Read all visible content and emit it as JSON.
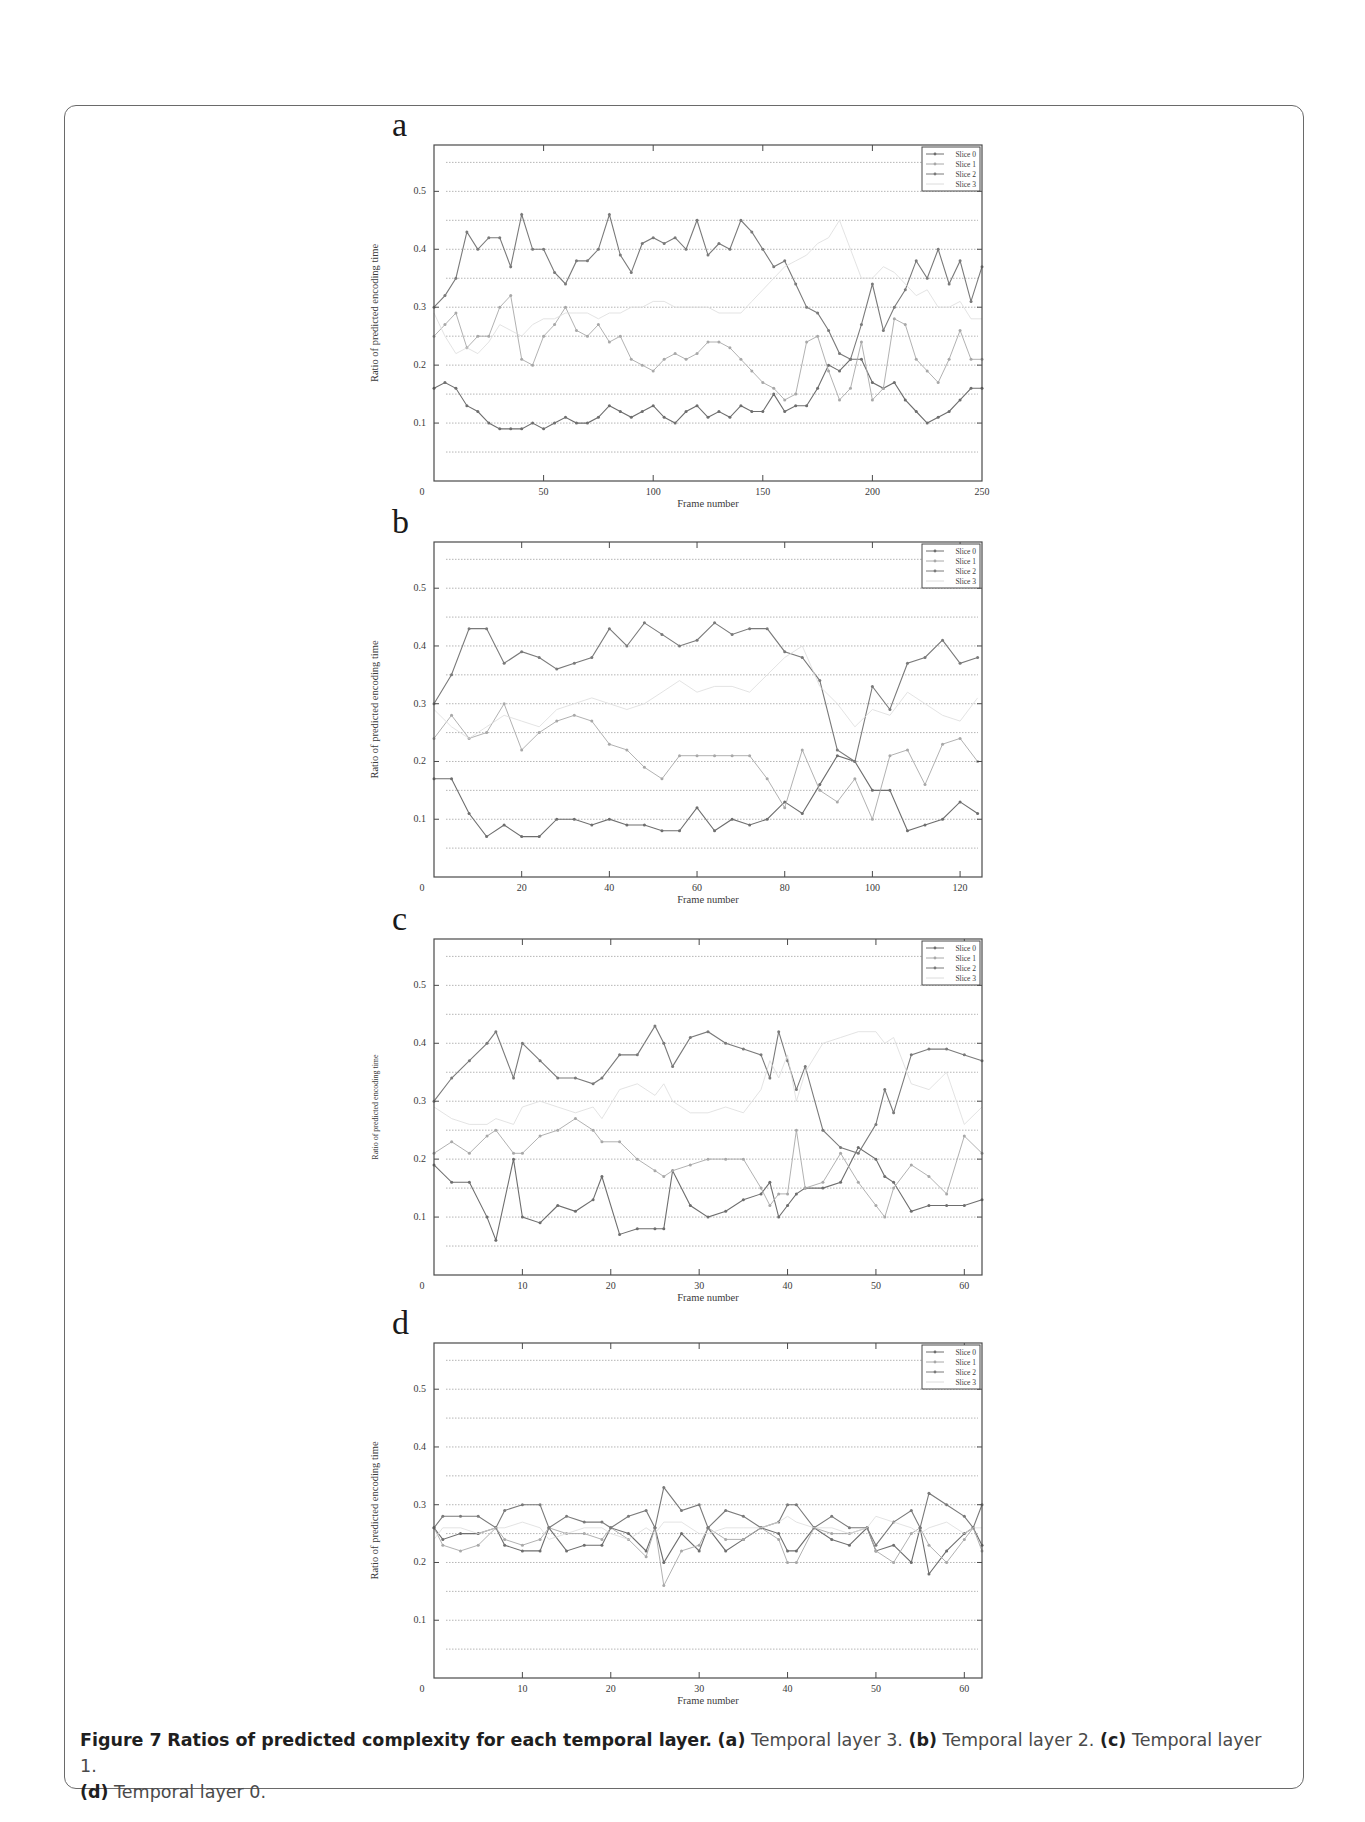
{
  "figure": {
    "caption": {
      "label": "Figure 7",
      "title": "Ratios of predicted complexity for each temporal layer.",
      "parts": [
        {
          "tag": "(a)",
          "text": "Temporal layer 3."
        },
        {
          "tag": "(b)",
          "text": "Temporal layer 2."
        },
        {
          "tag": "(c)",
          "text": "Temporal layer 1."
        },
        {
          "tag": "(d)",
          "text": "Temporal layer 0."
        }
      ]
    },
    "colors": {
      "frame_border": "#6a6a6a",
      "axis": "#4a4a4a",
      "grid": "#b5b5b5",
      "slice0": "#6e6e6e",
      "slice1": "#a8a8a8",
      "slice2": "#7a7a7a",
      "slice3": "#dcdcdc"
    }
  },
  "chart_data": [
    {
      "panel": "a",
      "type": "line",
      "title": "",
      "xlabel": "Frame number",
      "ylabel": "Ratio of predicted encoding time",
      "xlim": [
        0,
        250
      ],
      "ylim": [
        0,
        0.58
      ],
      "xticks": [
        0,
        50,
        100,
        150,
        200,
        250
      ],
      "yticks": [
        0.1,
        0.2,
        0.3,
        0.4,
        0.5
      ],
      "grid": true,
      "grid_step": 0.05,
      "legend": [
        "Slice 0",
        "Slice 1",
        "Slice 2",
        "Slice 3"
      ],
      "legend_position": "upper right",
      "x": [
        0,
        5,
        10,
        15,
        20,
        25,
        30,
        35,
        40,
        45,
        50,
        55,
        60,
        65,
        70,
        75,
        80,
        85,
        90,
        95,
        100,
        105,
        110,
        115,
        120,
        125,
        130,
        135,
        140,
        145,
        150,
        155,
        160,
        165,
        170,
        175,
        180,
        185,
        190,
        195,
        200,
        205,
        210,
        215,
        220,
        225,
        230,
        235,
        240,
        245,
        250
      ],
      "series": [
        {
          "name": "Slice 0",
          "values": [
            0.16,
            0.17,
            0.16,
            0.13,
            0.12,
            0.1,
            0.09,
            0.09,
            0.09,
            0.1,
            0.09,
            0.1,
            0.11,
            0.1,
            0.1,
            0.11,
            0.13,
            0.12,
            0.11,
            0.12,
            0.13,
            0.11,
            0.1,
            0.12,
            0.13,
            0.11,
            0.12,
            0.11,
            0.13,
            0.12,
            0.12,
            0.15,
            0.12,
            0.13,
            0.13,
            0.16,
            0.2,
            0.19,
            0.21,
            0.21,
            0.17,
            0.16,
            0.17,
            0.14,
            0.12,
            0.1,
            0.11,
            0.12,
            0.14,
            0.16,
            0.16
          ]
        },
        {
          "name": "Slice 1",
          "values": [
            0.25,
            0.27,
            0.29,
            0.23,
            0.25,
            0.25,
            0.3,
            0.32,
            0.21,
            0.2,
            0.25,
            0.27,
            0.3,
            0.26,
            0.25,
            0.27,
            0.24,
            0.25,
            0.21,
            0.2,
            0.19,
            0.21,
            0.22,
            0.21,
            0.22,
            0.24,
            0.24,
            0.23,
            0.21,
            0.19,
            0.17,
            0.16,
            0.14,
            0.15,
            0.24,
            0.25,
            0.19,
            0.14,
            0.16,
            0.24,
            0.14,
            0.16,
            0.28,
            0.27,
            0.21,
            0.19,
            0.17,
            0.21,
            0.26,
            0.21,
            0.21
          ]
        },
        {
          "name": "Slice 2",
          "values": [
            0.3,
            0.32,
            0.35,
            0.43,
            0.4,
            0.42,
            0.42,
            0.37,
            0.46,
            0.4,
            0.4,
            0.36,
            0.34,
            0.38,
            0.38,
            0.4,
            0.46,
            0.39,
            0.36,
            0.41,
            0.42,
            0.41,
            0.42,
            0.4,
            0.45,
            0.39,
            0.41,
            0.4,
            0.45,
            0.43,
            0.4,
            0.37,
            0.38,
            0.34,
            0.3,
            0.29,
            0.26,
            0.22,
            0.21,
            0.27,
            0.34,
            0.26,
            0.3,
            0.33,
            0.38,
            0.35,
            0.4,
            0.34,
            0.38,
            0.31,
            0.37
          ]
        },
        {
          "name": "Slice 3",
          "values": [
            0.29,
            0.25,
            0.22,
            0.23,
            0.22,
            0.24,
            0.27,
            0.26,
            0.25,
            0.27,
            0.28,
            0.28,
            0.29,
            0.29,
            0.29,
            0.28,
            0.29,
            0.29,
            0.3,
            0.3,
            0.31,
            0.31,
            0.3,
            0.3,
            0.3,
            0.3,
            0.29,
            0.29,
            0.29,
            0.31,
            0.33,
            0.35,
            0.37,
            0.38,
            0.39,
            0.41,
            0.42,
            0.45,
            0.4,
            0.35,
            0.35,
            0.37,
            0.36,
            0.34,
            0.32,
            0.33,
            0.3,
            0.3,
            0.31,
            0.28,
            0.28
          ]
        }
      ]
    },
    {
      "panel": "b",
      "type": "line",
      "title": "",
      "xlabel": "Frame number",
      "ylabel": "Ratio of predicted encoding time",
      "xlim": [
        0,
        125
      ],
      "ylim": [
        0,
        0.58
      ],
      "xticks": [
        0,
        20,
        40,
        60,
        80,
        100,
        120
      ],
      "yticks": [
        0.1,
        0.2,
        0.3,
        0.4,
        0.5
      ],
      "grid": true,
      "grid_step": 0.05,
      "legend": [
        "Slice 0",
        "Slice 1",
        "Slice 2",
        "Slice 3"
      ],
      "legend_position": "upper right",
      "x": [
        0,
        4,
        8,
        12,
        16,
        20,
        24,
        28,
        32,
        36,
        40,
        44,
        48,
        52,
        56,
        60,
        64,
        68,
        72,
        76,
        80,
        84,
        88,
        92,
        96,
        100,
        104,
        108,
        112,
        116,
        120,
        124
      ],
      "series": [
        {
          "name": "Slice 0",
          "values": [
            0.17,
            0.17,
            0.11,
            0.07,
            0.09,
            0.07,
            0.07,
            0.1,
            0.1,
            0.09,
            0.1,
            0.09,
            0.09,
            0.08,
            0.08,
            0.12,
            0.08,
            0.1,
            0.09,
            0.1,
            0.13,
            0.11,
            0.16,
            0.21,
            0.2,
            0.15,
            0.15,
            0.08,
            0.09,
            0.1,
            0.13,
            0.11
          ]
        },
        {
          "name": "Slice 1",
          "values": [
            0.24,
            0.28,
            0.24,
            0.25,
            0.3,
            0.22,
            0.25,
            0.27,
            0.28,
            0.27,
            0.23,
            0.22,
            0.19,
            0.17,
            0.21,
            0.21,
            0.21,
            0.21,
            0.21,
            0.17,
            0.12,
            0.22,
            0.15,
            0.13,
            0.17,
            0.1,
            0.21,
            0.22,
            0.16,
            0.23,
            0.24,
            0.2
          ]
        },
        {
          "name": "Slice 2",
          "values": [
            0.3,
            0.35,
            0.43,
            0.43,
            0.37,
            0.39,
            0.38,
            0.36,
            0.37,
            0.38,
            0.43,
            0.4,
            0.44,
            0.42,
            0.4,
            0.41,
            0.44,
            0.42,
            0.43,
            0.43,
            0.39,
            0.38,
            0.34,
            0.22,
            0.2,
            0.33,
            0.29,
            0.37,
            0.38,
            0.41,
            0.37,
            0.38
          ]
        },
        {
          "name": "Slice 3",
          "values": [
            0.29,
            0.26,
            0.24,
            0.26,
            0.28,
            0.27,
            0.26,
            0.29,
            0.3,
            0.31,
            0.3,
            0.29,
            0.3,
            0.32,
            0.34,
            0.32,
            0.33,
            0.33,
            0.32,
            0.35,
            0.38,
            0.4,
            0.33,
            0.3,
            0.26,
            0.29,
            0.28,
            0.32,
            0.3,
            0.28,
            0.27,
            0.31
          ]
        }
      ]
    },
    {
      "panel": "c",
      "type": "line",
      "title": "",
      "xlabel": "Frame number",
      "ylabel": "Ratio of predicted encoding time",
      "xlim": [
        0,
        62
      ],
      "ylim": [
        0,
        0.58
      ],
      "xticks": [
        0,
        10,
        20,
        30,
        40,
        50,
        60
      ],
      "yticks": [
        0.1,
        0.2,
        0.3,
        0.4,
        0.5
      ],
      "grid": true,
      "grid_step": 0.05,
      "legend": [
        "Slice 0",
        "Slice 1",
        "Slice 2",
        "Slice 3"
      ],
      "legend_position": "upper right",
      "x": [
        0,
        2,
        4,
        6,
        7,
        9,
        10,
        12,
        14,
        16,
        18,
        19,
        21,
        23,
        25,
        26,
        27,
        29,
        31,
        33,
        35,
        37,
        38,
        39,
        40,
        41,
        42,
        44,
        46,
        48,
        50,
        51,
        52,
        54,
        56,
        58,
        60,
        62
      ],
      "series": [
        {
          "name": "Slice 0",
          "values": [
            0.19,
            0.16,
            0.16,
            0.1,
            0.06,
            0.2,
            0.1,
            0.09,
            0.12,
            0.11,
            0.13,
            0.17,
            0.07,
            0.08,
            0.08,
            0.08,
            0.18,
            0.12,
            0.1,
            0.11,
            0.13,
            0.14,
            0.16,
            0.1,
            0.12,
            0.14,
            0.15,
            0.15,
            0.16,
            0.22,
            0.2,
            0.17,
            0.16,
            0.11,
            0.12,
            0.12,
            0.12,
            0.13
          ]
        },
        {
          "name": "Slice 1",
          "values": [
            0.21,
            0.23,
            0.21,
            0.24,
            0.25,
            0.21,
            0.21,
            0.24,
            0.25,
            0.27,
            0.25,
            0.23,
            0.23,
            0.2,
            0.18,
            0.17,
            0.18,
            0.19,
            0.2,
            0.2,
            0.2,
            0.15,
            0.12,
            0.14,
            0.14,
            0.25,
            0.15,
            0.16,
            0.21,
            0.16,
            0.12,
            0.1,
            0.15,
            0.19,
            0.17,
            0.14,
            0.24,
            0.21
          ]
        },
        {
          "name": "Slice 2",
          "values": [
            0.3,
            0.34,
            0.37,
            0.4,
            0.42,
            0.34,
            0.4,
            0.37,
            0.34,
            0.34,
            0.33,
            0.34,
            0.38,
            0.38,
            0.43,
            0.4,
            0.36,
            0.41,
            0.42,
            0.4,
            0.39,
            0.38,
            0.34,
            0.42,
            0.37,
            0.32,
            0.36,
            0.25,
            0.22,
            0.21,
            0.26,
            0.32,
            0.28,
            0.38,
            0.39,
            0.39,
            0.38,
            0.37
          ]
        },
        {
          "name": "Slice 3",
          "values": [
            0.29,
            0.27,
            0.26,
            0.26,
            0.27,
            0.26,
            0.29,
            0.3,
            0.29,
            0.28,
            0.29,
            0.27,
            0.32,
            0.33,
            0.31,
            0.33,
            0.3,
            0.28,
            0.28,
            0.29,
            0.28,
            0.32,
            0.37,
            0.34,
            0.38,
            0.3,
            0.35,
            0.4,
            0.41,
            0.42,
            0.42,
            0.4,
            0.41,
            0.33,
            0.32,
            0.35,
            0.26,
            0.29
          ]
        }
      ]
    },
    {
      "panel": "d",
      "type": "line",
      "title": "",
      "xlabel": "Frame number",
      "ylabel": "Ratio of predicted encoding time",
      "xlim": [
        0,
        62
      ],
      "ylim": [
        0,
        0.58
      ],
      "xticks": [
        0,
        10,
        20,
        30,
        40,
        50,
        60
      ],
      "yticks": [
        0.1,
        0.2,
        0.3,
        0.4,
        0.5
      ],
      "grid": true,
      "grid_step": 0.05,
      "legend": [
        "Slice 0",
        "Slice 1",
        "Slice 2",
        "Slice 3"
      ],
      "legend_position": "upper right",
      "x": [
        0,
        1,
        3,
        5,
        7,
        8,
        10,
        12,
        13,
        15,
        17,
        19,
        20,
        22,
        24,
        25,
        26,
        28,
        30,
        31,
        33,
        35,
        37,
        39,
        40,
        41,
        43,
        45,
        47,
        49,
        50,
        52,
        54,
        55,
        56,
        58,
        60,
        61,
        62
      ],
      "series": [
        {
          "name": "Slice 0",
          "values": [
            0.26,
            0.24,
            0.25,
            0.25,
            0.26,
            0.23,
            0.22,
            0.22,
            0.26,
            0.22,
            0.23,
            0.23,
            0.26,
            0.25,
            0.22,
            0.26,
            0.2,
            0.25,
            0.22,
            0.26,
            0.22,
            0.24,
            0.26,
            0.25,
            0.22,
            0.22,
            0.26,
            0.24,
            0.23,
            0.26,
            0.22,
            0.23,
            0.2,
            0.26,
            0.18,
            0.22,
            0.25,
            0.26,
            0.23
          ]
        },
        {
          "name": "Slice 1",
          "values": [
            0.26,
            0.23,
            0.22,
            0.23,
            0.26,
            0.24,
            0.23,
            0.24,
            0.26,
            0.25,
            0.25,
            0.24,
            0.26,
            0.24,
            0.21,
            0.26,
            0.16,
            0.22,
            0.23,
            0.26,
            0.24,
            0.24,
            0.26,
            0.24,
            0.2,
            0.2,
            0.26,
            0.25,
            0.25,
            0.26,
            0.22,
            0.2,
            0.25,
            0.26,
            0.23,
            0.2,
            0.24,
            0.26,
            0.22
          ]
        },
        {
          "name": "Slice 2",
          "values": [
            0.26,
            0.28,
            0.28,
            0.28,
            0.26,
            0.29,
            0.3,
            0.3,
            0.26,
            0.28,
            0.27,
            0.27,
            0.26,
            0.28,
            0.29,
            0.26,
            0.33,
            0.29,
            0.3,
            0.26,
            0.29,
            0.28,
            0.26,
            0.27,
            0.3,
            0.3,
            0.26,
            0.28,
            0.26,
            0.26,
            0.23,
            0.27,
            0.29,
            0.26,
            0.32,
            0.3,
            0.28,
            0.26,
            0.3
          ]
        },
        {
          "name": "Slice 3",
          "values": [
            0.24,
            0.26,
            0.26,
            0.25,
            0.26,
            0.26,
            0.27,
            0.26,
            0.24,
            0.25,
            0.26,
            0.26,
            0.25,
            0.24,
            0.26,
            0.25,
            0.27,
            0.27,
            0.25,
            0.25,
            0.26,
            0.26,
            0.26,
            0.27,
            0.28,
            0.27,
            0.26,
            0.26,
            0.25,
            0.26,
            0.28,
            0.27,
            0.26,
            0.25,
            0.26,
            0.27,
            0.25,
            0.26,
            0.26
          ]
        }
      ]
    }
  ]
}
